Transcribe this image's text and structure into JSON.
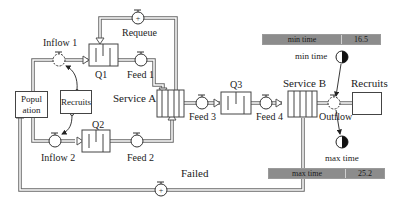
{
  "diagram": {
    "type": "stock-and-flow queueing model",
    "stocks": {
      "population": "Popul\nation",
      "population_line1": "Popul",
      "population_line2": "ation",
      "recruits_left": "Recruits",
      "recruits_right": "Recruits"
    },
    "queues": {
      "q1": "Q1",
      "q2": "Q2",
      "q3": "Q3"
    },
    "conveyors": {
      "service_a": "Service A",
      "service_b": "Service B"
    },
    "flows": {
      "inflow1": "Inflow 1",
      "inflow2": "Inflow 2",
      "feed1": "Feed 1",
      "feed2": "Feed 2",
      "feed3": "Feed 3",
      "feed4": "Feed 4",
      "requeue": "Requeue",
      "outflow": "Outflow",
      "failed": "Failed"
    },
    "converters": {
      "min_time": "min time",
      "max_time": "max time"
    },
    "readouts": {
      "min": {
        "label": "min time",
        "value": "16.5"
      },
      "max": {
        "label": "max time",
        "value": "25.2"
      }
    }
  }
}
